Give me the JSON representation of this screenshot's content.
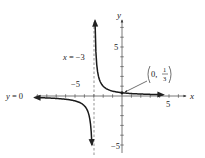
{
  "chart_data": {
    "type": "line",
    "title": "",
    "function": "f(x) = 1/(x+3)",
    "xlabel": "x",
    "ylabel": "y",
    "xlim": [
      -12,
      7
    ],
    "ylim": [
      -5.2,
      7.7
    ],
    "x_ticks_labeled": [
      {
        "value": -5,
        "label": "−5"
      },
      {
        "value": 5,
        "label": "5"
      }
    ],
    "y_ticks_labeled": [
      {
        "value": 5,
        "label": "5"
      },
      {
        "value": -5,
        "label": "−5"
      }
    ],
    "tick_interval": 1,
    "grid": false,
    "series": [
      {
        "name": "right branch",
        "x": [
          -2.87,
          -2.8,
          -2.6,
          -2.4,
          -2.2,
          -2.0,
          -1.5,
          -1.0,
          0,
          1,
          2,
          3,
          4.4
        ],
        "values": [
          7.5,
          5.0,
          2.5,
          1.67,
          1.25,
          1.0,
          0.667,
          0.5,
          0.333,
          0.25,
          0.2,
          0.167,
          0.135
        ]
      },
      {
        "name": "left branch",
        "x": [
          -9.3,
          -8,
          -6,
          -5,
          -4.5,
          -4,
          -3.5,
          -3.3,
          -3.2
        ],
        "values": [
          -0.159,
          -0.2,
          -0.333,
          -0.5,
          -0.667,
          -1.0,
          -2.0,
          -3.33,
          -5.0
        ]
      }
    ],
    "asymptotes": [
      {
        "type": "vertical",
        "value": -3,
        "label": "x = −3",
        "style": "dashed"
      },
      {
        "type": "horizontal",
        "value": 0,
        "label": "y = 0"
      }
    ],
    "annotations": [
      {
        "text": "(0, 1/3)",
        "point": [
          0,
          0.333
        ],
        "arrow": true
      }
    ]
  },
  "labels": {
    "x_axis": "x",
    "y_axis": "y",
    "x_tick_neg5": "−5",
    "x_tick_5": "5",
    "y_tick_5": "5",
    "y_tick_neg5": "−5",
    "vertical_asymptote": "x = −3",
    "horizontal_asymptote": "y = 0",
    "point_label_prefix": "0,",
    "point_num": "1",
    "point_den": "3"
  }
}
